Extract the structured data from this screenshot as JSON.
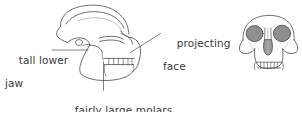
{
  "figure": {
    "background_color": "#ffffff",
    "ink_color": "#4a4a4a",
    "text_color": "#3b3b3b",
    "fill_gray": "#8f8f8f",
    "width": 302,
    "height": 112
  },
  "labels": {
    "tall_lower_jaw": {
      "line1": "tall lower",
      "line2": "jaw"
    },
    "projecting_face": {
      "line1": "projecting",
      "line2": "face"
    },
    "fairly_large_molars": {
      "line1": "fairly large molars"
    }
  },
  "specimens": {
    "lateral": {
      "name": "lateral skull view",
      "parts": [
        "cranium",
        "brow ridge",
        "orbit",
        "zygomatic arch",
        "projecting face",
        "maxilla",
        "molar tooth row",
        "tall lower jaw",
        "mandible"
      ]
    },
    "frontal": {
      "name": "frontal skull view",
      "parts": [
        "cranial vault",
        "left orbit",
        "right orbit",
        "nasal aperture",
        "zygomatic arch",
        "upper tooth row",
        "lower tooth row",
        "canine"
      ]
    }
  }
}
